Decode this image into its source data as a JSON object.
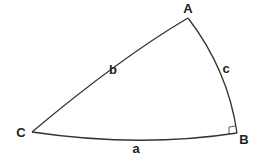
{
  "diagram": {
    "vertices": [
      {
        "label": "A",
        "x": 188,
        "y": 18,
        "lx": 188,
        "ly": 13
      },
      {
        "label": "B",
        "x": 237,
        "y": 133,
        "lx": 244,
        "ly": 144
      },
      {
        "label": "C",
        "x": 32,
        "y": 132,
        "lx": 21,
        "ly": 137
      }
    ],
    "sides": [
      {
        "label": "a",
        "lx": 136,
        "ly": 153
      },
      {
        "label": "b",
        "lx": 113,
        "ly": 74
      },
      {
        "label": "c",
        "lx": 226,
        "ly": 73
      }
    ],
    "right_angle_at": "B",
    "stroke_color": "#333333"
  }
}
